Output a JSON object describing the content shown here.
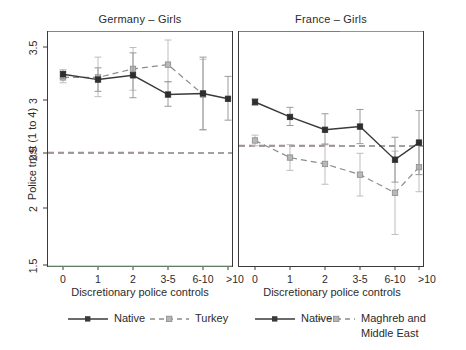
{
  "figure": {
    "width": 466,
    "height": 350,
    "background": "#ffffff"
  },
  "axes": {
    "ylabel": "Police trust (1 to 4)",
    "xlabel": "Discretionary police controls",
    "yticks": [
      "1.5",
      "2",
      "2.5",
      "3",
      "3.5"
    ],
    "ytick_values": [
      1.5,
      2,
      2.5,
      3,
      3.5
    ],
    "ylim": [
      1.42,
      3.62
    ],
    "xtick_labels": [
      "0",
      "1",
      "2",
      "3-5",
      "6-10",
      ">10"
    ]
  },
  "panels": [
    {
      "title": "Germany – Girls"
    },
    {
      "title": "France – Girls"
    }
  ],
  "legend": {
    "left": [
      {
        "label": "Native",
        "style": "solid",
        "color": "#3a3a3a"
      },
      {
        "label": "Turkey",
        "style": "dashed",
        "color": "#8c8c8c"
      }
    ],
    "right": [
      {
        "label": "Native",
        "style": "solid",
        "color": "#3a3a3a"
      },
      {
        "label": "Maghreb and\nMiddle East",
        "label_line1": "Maghreb and",
        "label_line2": "Middle East",
        "style": "dashed",
        "color": "#8c8c8c"
      }
    ]
  },
  "chart_data": {
    "type": "line",
    "xlabel": "Discretionary police controls",
    "ylabel": "Police trust (1 to 4)",
    "ylim": [
      1.42,
      3.62
    ],
    "yticks": [
      1.5,
      2,
      2.5,
      3,
      3.5
    ],
    "grid": false,
    "legend_position": "bottom",
    "categories": [
      "0",
      "1",
      "2",
      "3-5",
      "6-10",
      ">10"
    ],
    "panels": [
      {
        "title": "Germany – Girls",
        "reference_line": 2.5,
        "series": [
          {
            "name": "Native",
            "style": "solid",
            "color": "#3a3a3a",
            "values": [
              3.22,
              3.17,
              3.21,
              3.03,
              3.04,
              2.99
            ],
            "ci_low": [
              3.18,
              3.06,
              3.0,
              2.92,
              2.7,
              2.79
            ],
            "ci_high": [
              3.26,
              3.28,
              3.42,
              3.15,
              3.38,
              3.2
            ]
          },
          {
            "name": "Turkey",
            "style": "dashed",
            "color": "#8c8c8c",
            "values": [
              3.19,
              3.19,
              3.27,
              3.31,
              3.03,
              null
            ],
            "ci_low": [
              3.14,
              3.01,
              3.07,
              3.15,
              2.7,
              null
            ],
            "ci_high": [
              3.24,
              3.38,
              3.47,
              3.54,
              3.36,
              null
            ]
          }
        ]
      },
      {
        "title": "France – Girls",
        "reference_line": 2.6,
        "series": [
          {
            "name": "Native",
            "style": "solid",
            "color": "#3a3a3a",
            "values": [
              2.96,
              2.82,
              2.7,
              2.73,
              2.42,
              2.58
            ],
            "ci_low": [
              2.93,
              2.74,
              2.56,
              2.57,
              2.21,
              2.28
            ],
            "ci_high": [
              2.99,
              2.91,
              2.85,
              2.89,
              2.63,
              2.88
            ]
          },
          {
            "name": "Maghreb and Middle East",
            "style": "dashed",
            "color": "#8c8c8c",
            "values": [
              2.6,
              2.44,
              2.38,
              2.28,
              2.11,
              2.35
            ],
            "ci_low": [
              2.55,
              2.32,
              2.19,
              2.08,
              1.72,
              2.12
            ],
            "ci_high": [
              2.65,
              2.56,
              2.57,
              2.48,
              2.5,
              2.58
            ]
          }
        ]
      }
    ]
  }
}
